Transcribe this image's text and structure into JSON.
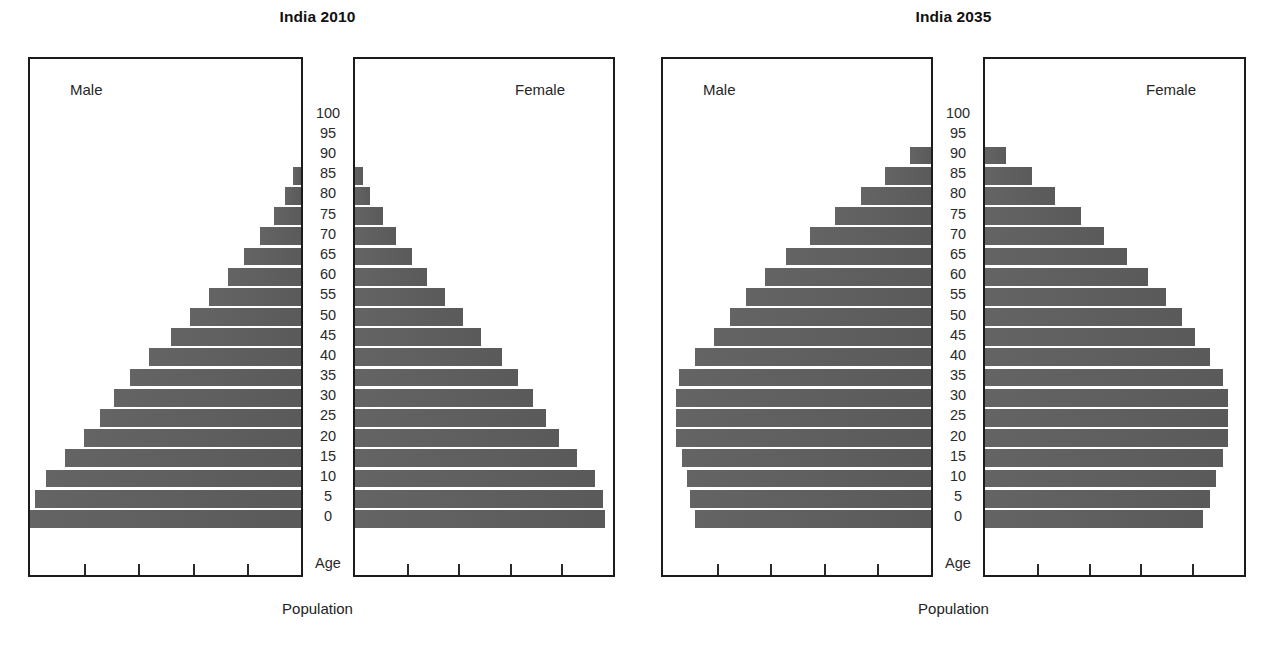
{
  "charts": [
    {
      "title": "India 2010",
      "male_label": "Male",
      "female_label": "Female",
      "age_caption": "Age",
      "population_caption": "Population"
    },
    {
      "title": "India 2035",
      "male_label": "Male",
      "female_label": "Female",
      "age_caption": "Age",
      "population_caption": "Population"
    }
  ],
  "age_labels": [
    "100",
    "95",
    "90",
    "85",
    "80",
    "75",
    "70",
    "65",
    "60",
    "55",
    "50",
    "45",
    "40",
    "35",
    "30",
    "25",
    "20",
    "15",
    "10",
    "5",
    "0"
  ],
  "colors": {
    "bar": "#5d5d5d",
    "panel_border": "#1b1b1b",
    "text": "#1a1a1a",
    "background": "#ffffff"
  },
  "chart_data": [
    {
      "type": "bar",
      "title": "India 2010",
      "subtitle": "",
      "xlabel": "Population",
      "ylabel": "Age",
      "orientation": "horizontal",
      "layout": "population-pyramid",
      "grid": false,
      "legend": [
        "Male",
        "Female"
      ],
      "legend_position": "inside-panel-top",
      "axis_ticks_per_panel": 4,
      "xlim": [
        0,
        100
      ],
      "categories": [
        "0",
        "5",
        "10",
        "15",
        "20",
        "25",
        "30",
        "35",
        "40",
        "45",
        "50",
        "55",
        "60",
        "65",
        "70",
        "75",
        "80",
        "85",
        "90",
        "95",
        "100"
      ],
      "series": [
        {
          "name": "Male",
          "direction": "left",
          "values": [
            100,
            98,
            94,
            87,
            80,
            74,
            69,
            63,
            56,
            48,
            41,
            34,
            27,
            21,
            15,
            10,
            6,
            3,
            0,
            0,
            0
          ]
        },
        {
          "name": "Female",
          "direction": "right",
          "values": [
            97,
            96,
            93,
            86,
            79,
            74,
            69,
            63,
            57,
            49,
            42,
            35,
            28,
            22,
            16,
            11,
            6,
            3,
            0,
            0,
            0
          ]
        }
      ]
    },
    {
      "type": "bar",
      "title": "India 2035",
      "subtitle": "",
      "xlabel": "Population",
      "ylabel": "Age",
      "orientation": "horizontal",
      "layout": "population-pyramid",
      "grid": false,
      "legend": [
        "Male",
        "Female"
      ],
      "legend_position": "inside-panel-top",
      "axis_ticks_per_panel": 4,
      "xlim": [
        0,
        100
      ],
      "categories": [
        "0",
        "5",
        "10",
        "15",
        "20",
        "25",
        "30",
        "35",
        "40",
        "45",
        "50",
        "55",
        "60",
        "65",
        "70",
        "75",
        "80",
        "85",
        "90",
        "95",
        "100"
      ],
      "series": [
        {
          "name": "Male",
          "direction": "left",
          "values": [
            88,
            90,
            91,
            93,
            95,
            95,
            95,
            94,
            88,
            81,
            75,
            69,
            62,
            54,
            45,
            36,
            26,
            17,
            8,
            0,
            0
          ]
        },
        {
          "name": "Female",
          "direction": "right",
          "values": [
            84,
            87,
            89,
            92,
            94,
            94,
            94,
            92,
            87,
            81,
            76,
            70,
            63,
            55,
            46,
            37,
            27,
            18,
            8,
            0,
            0
          ]
        }
      ]
    }
  ]
}
